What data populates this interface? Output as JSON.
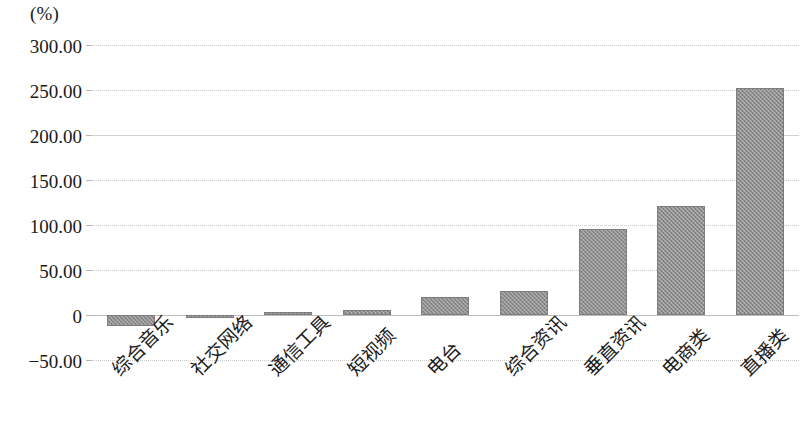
{
  "chart_data": {
    "type": "bar",
    "title": "",
    "subtitle": "",
    "unit_label": "(%)",
    "xlabel": "",
    "ylabel": "",
    "ylim": [
      -50,
      300
    ],
    "ytick_labels": [
      "300.00",
      "250.00",
      "200.00",
      "150.00",
      "100.00",
      "50.00",
      "0",
      "-50.00"
    ],
    "ytick_values": [
      300,
      250,
      200,
      150,
      100,
      50,
      0,
      -50
    ],
    "grid": true,
    "grid_axis": "y",
    "legend": false,
    "legend_position": "none",
    "bar_color": "#8e8e8e",
    "categories": [
      "综合音乐",
      "社交网络",
      "通信工具",
      "短视频",
      "电台",
      "综合资讯",
      "垂直资讯",
      "电商类",
      "直播类"
    ],
    "values": [
      -12,
      -2,
      3,
      6,
      20,
      27,
      95.5,
      121,
      252
    ],
    "series": [
      {
        "name": "",
        "values": [
          -12,
          -2,
          3,
          6,
          20,
          27,
          95.5,
          121,
          252
        ]
      }
    ]
  },
  "axis": {
    "y": {
      "ticks": [
        {
          "label": "300.00",
          "value": 300
        },
        {
          "label": "250.00",
          "value": 250
        },
        {
          "label": "200.00",
          "value": 200
        },
        {
          "label": "150.00",
          "value": 150
        },
        {
          "label": "100.00",
          "value": 100
        },
        {
          "label": "50.00",
          "value": 50
        },
        {
          "label": "0",
          "value": 0
        },
        {
          "label": "-50.00",
          "value": -50
        }
      ]
    },
    "x": {
      "ticks": [
        {
          "label": "综合音乐"
        },
        {
          "label": "社交网络"
        },
        {
          "label": "通信工具"
        },
        {
          "label": "短视频"
        },
        {
          "label": "电台"
        },
        {
          "label": "综合资讯"
        },
        {
          "label": "垂直资讯"
        },
        {
          "label": "电商类"
        },
        {
          "label": "直播类"
        }
      ]
    }
  }
}
